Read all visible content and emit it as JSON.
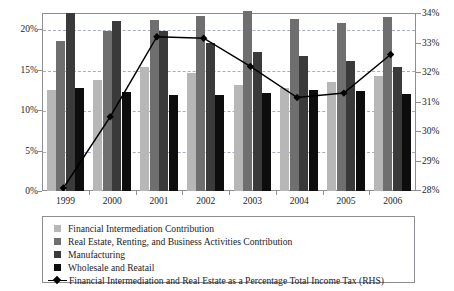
{
  "chart_data": {
    "type": "bar",
    "title": "",
    "xlabel": "",
    "ylabel": "",
    "categories": [
      "1999",
      "2000",
      "2001",
      "2002",
      "2003",
      "2004",
      "2005",
      "2006"
    ],
    "ylim": [
      0,
      20
    ],
    "y_ticks": [
      "0%",
      "5%",
      "10%",
      "15%",
      "20%"
    ],
    "y_tick_values": [
      0,
      5,
      10,
      15,
      20
    ],
    "y2lim": [
      28,
      34
    ],
    "y2_ticks": [
      "28%",
      "29%",
      "30%",
      "31%",
      "32%",
      "33%",
      "34%"
    ],
    "y2_tick_values": [
      28,
      29,
      30,
      31,
      32,
      33,
      34
    ],
    "grid": true,
    "legend_position": "below",
    "series": [
      {
        "name": "Financial Intermediation Contribution",
        "axis": "left",
        "color": "#b7b7b7",
        "type": "bar",
        "values": [
          11.4,
          12.5,
          13.9,
          13.3,
          11.9,
          11.6,
          12.2,
          12.9
        ]
      },
      {
        "name": "Real Estate, Renting, and Business Activities Contribution",
        "axis": "left",
        "color": "#6f6f6f",
        "type": "bar",
        "values": [
          16.8,
          18.0,
          19.2,
          19.7,
          20.2,
          19.3,
          18.9,
          19.5
        ]
      },
      {
        "name": "Manufacturing",
        "axis": "left",
        "color": "#3a3a3a",
        "type": "bar",
        "values": [
          20.0,
          19.1,
          18.0,
          16.6,
          15.6,
          15.2,
          14.6,
          13.9
        ]
      },
      {
        "name": "Wholesale and Reatail",
        "axis": "left",
        "color": "#0d0d0d",
        "type": "bar",
        "values": [
          11.6,
          11.1,
          10.8,
          10.8,
          11.0,
          11.4,
          11.2,
          10.9
        ]
      },
      {
        "name": "Financial Intermediation and Real Estate as a Percentage Total Income Tax (RHS)",
        "axis": "right",
        "color": "#000000",
        "type": "line",
        "marker": "diamond",
        "values": [
          28.1,
          30.5,
          33.2,
          33.15,
          32.2,
          31.15,
          31.3,
          32.6
        ]
      }
    ]
  },
  "legend": {
    "items": [
      {
        "label": "Financial Intermediation Contribution",
        "swatch": "square-light-gray"
      },
      {
        "label": "Real Estate, Renting, and Business Activities Contribution",
        "swatch": "square-medium-gray"
      },
      {
        "label": "Manufacturing",
        "swatch": "square-dark-gray"
      },
      {
        "label": "Wholesale and Reatail",
        "swatch": "square-black"
      },
      {
        "label": "Financial Intermediation and Real Estate as a Percentage Total Income Tax (RHS)",
        "swatch": "line-diamond-marker"
      }
    ]
  }
}
